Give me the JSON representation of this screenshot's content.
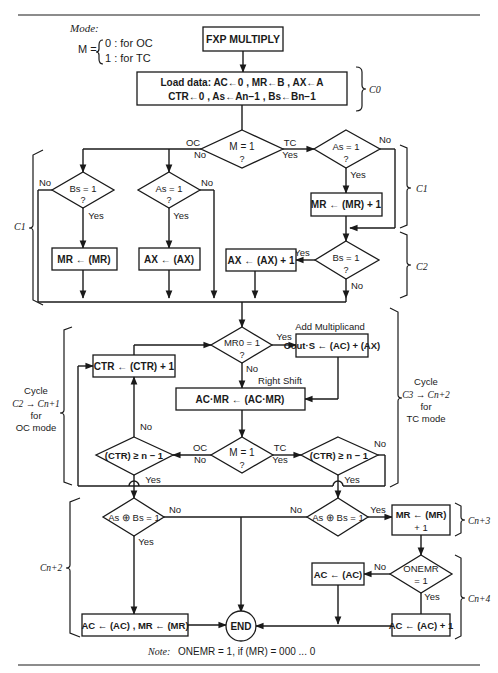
{
  "mode_legend": {
    "title": "Mode:",
    "lhs": "M =",
    "opt0": "0 : for OC",
    "opt1": "1 : for TC"
  },
  "start": "FXP MULTIPLY",
  "load": {
    "line1": "Load data: AC←0 , MR←B , AX←A",
    "line2": "CTR←0 , As←An−1 , Bs←Bn−1"
  },
  "decisions": {
    "mode1": "M = 1",
    "as_tc": "As = 1",
    "bs_oc": "Bs = 1",
    "as_oc": "As = 1",
    "bs_tc": "Bs = 1",
    "mr0": "MR0 = 1",
    "mode2": "M = 1",
    "ctr_oc": "(CTR) ≥ n − 1",
    "ctr_tc": "(CTR) ≥ n − 1",
    "xor_oc": "As ⊕ Bs = 1",
    "xor_tc": "As ⊕ Bs = 1",
    "onemr_1": "ONEMR",
    "onemr_2": "= 1",
    "q": "?"
  },
  "processes": {
    "mr_comp_inc": "MR ← (MR) + 1",
    "mr_comp": "MR ← (MR)",
    "ax_comp": "AX ← (AX)",
    "ax_comp_inc": "AX ← (AX) + 1",
    "add": "Cout·S ← (AC) + (AX)",
    "shift": "AC·MR ← (AC·MR)",
    "ctr_inc": "CTR ← (CTR) + 1",
    "mr_final_1": "MR ← (MR)",
    "mr_final_2": "+ 1",
    "ac_comp": "AC ← (AC)",
    "ac_comp_inc": "AC ← (AC) + 1",
    "oc_final": "AC ← (AC) , MR ← (MR)",
    "end": "END"
  },
  "labels": {
    "oc": "OC",
    "tc": "TC",
    "yes": "Yes",
    "no": "No",
    "add_multiplicand": "Add Multiplicand",
    "right_shift": "Right Shift"
  },
  "braces": {
    "c0": "C0",
    "c1_left": "C1",
    "c1_right": "C1",
    "c2": "C2",
    "cn2": "Cn+2",
    "cn3": "Cn+3",
    "cn4": "Cn+4",
    "cycle_oc": [
      "Cycle",
      "C2 → Cn+1",
      "for",
      "OC mode"
    ],
    "cycle_tc": [
      "Cycle",
      "C3 → Cn+2",
      "for",
      "TC mode"
    ]
  },
  "note": {
    "prefix": "Note:",
    "text": "ONEMR = 1, if (MR) = 000 ... 0"
  }
}
